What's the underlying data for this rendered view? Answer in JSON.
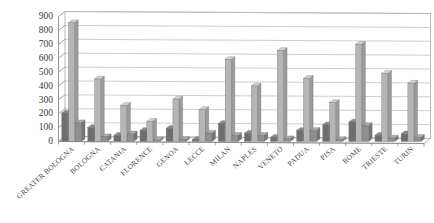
{
  "chart_data": {
    "type": "bar",
    "title": "",
    "subtitle": "",
    "xlabel": "",
    "ylabel": "",
    "ylim": [
      0,
      900
    ],
    "ytick_step": 100,
    "yticks": [
      0,
      100,
      200,
      300,
      400,
      500,
      600,
      700,
      800,
      900
    ],
    "grid": true,
    "legend": "none",
    "orientation": "vertical",
    "grouping": "clustered",
    "three_d": true,
    "categories": [
      "GREATER BOLOGNA",
      "BOLOGNA",
      "CATANIA",
      "FLORENCE",
      "GENOA",
      "LECCE",
      "MILAN",
      "NAPLES",
      "VENETO",
      "PADUA",
      "PISA",
      "ROME",
      "TRIESTE",
      "TURIN"
    ],
    "series": [
      {
        "name": "Series 1",
        "color": "#6e6e6e",
        "values": [
          205,
          100,
          45,
          80,
          95,
          15,
          130,
          60,
          30,
          80,
          120,
          140,
          45,
          55
        ]
      },
      {
        "name": "Series 2",
        "color": "#b5b5b5",
        "values": [
          855,
          450,
          260,
          145,
          305,
          230,
          590,
          400,
          655,
          455,
          280,
          700,
          490,
          420
        ]
      },
      {
        "name": "Series 3",
        "color": "#8f8f8f",
        "values": [
          135,
          35,
          55,
          10,
          15,
          60,
          45,
          45,
          20,
          80,
          15,
          115,
          25,
          30
        ]
      }
    ]
  },
  "axis": {
    "y_tick_labels": [
      "900",
      "800",
      "700",
      "600",
      "500",
      "400",
      "300",
      "200",
      "100",
      "0"
    ]
  }
}
